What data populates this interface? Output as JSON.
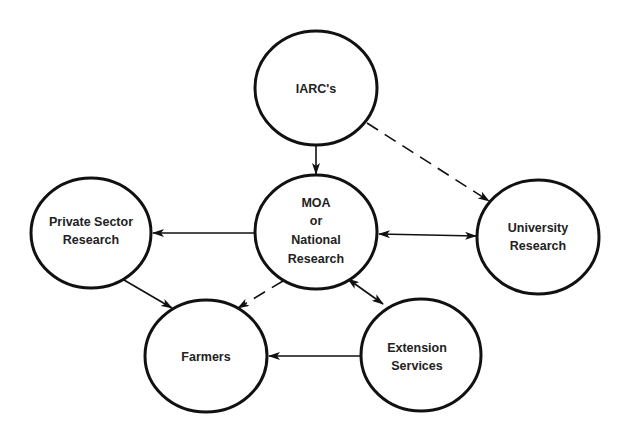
{
  "diagram": {
    "type": "network",
    "nodes": [
      {
        "id": "iarc",
        "lines": [
          "IARC's"
        ],
        "cx": 316,
        "cy": 88,
        "rx": 61,
        "ry": 57
      },
      {
        "id": "moa",
        "lines": [
          "MOA",
          "or",
          "National",
          "Research"
        ],
        "cx": 316,
        "cy": 232,
        "rx": 61,
        "ry": 57
      },
      {
        "id": "private",
        "lines": [
          "Private Sector",
          "Research"
        ],
        "cx": 91,
        "cy": 233,
        "rx": 60,
        "ry": 55
      },
      {
        "id": "university",
        "lines": [
          "University",
          "Research"
        ],
        "cx": 538,
        "cy": 237,
        "rx": 61,
        "ry": 57
      },
      {
        "id": "farmers",
        "lines": [
          "Farmers"
        ],
        "cx": 206,
        "cy": 356,
        "rx": 61,
        "ry": 56
      },
      {
        "id": "extension",
        "lines": [
          "Extension",
          "Services"
        ],
        "cx": 421,
        "cy": 355,
        "rx": 60,
        "ry": 56
      }
    ],
    "edges": [
      {
        "from": "iarc",
        "to": "moa",
        "style": "solid",
        "direction": "forward"
      },
      {
        "from": "iarc",
        "to": "university",
        "style": "dashed",
        "direction": "forward"
      },
      {
        "from": "moa",
        "to": "private",
        "style": "solid",
        "direction": "forward"
      },
      {
        "from": "moa",
        "to": "university",
        "style": "solid",
        "direction": "both"
      },
      {
        "from": "moa",
        "to": "farmers",
        "style": "dashed",
        "direction": "forward"
      },
      {
        "from": "moa",
        "to": "extension",
        "style": "solid",
        "direction": "both"
      },
      {
        "from": "private",
        "to": "farmers",
        "style": "solid",
        "direction": "forward"
      },
      {
        "from": "extension",
        "to": "farmers",
        "style": "solid",
        "direction": "forward"
      }
    ]
  },
  "labels": {
    "iarc": {
      "l1": "IARC's"
    },
    "moa": {
      "l1": "MOA",
      "l2": "or",
      "l3": "National",
      "l4": "Research"
    },
    "private": {
      "l1": "Private Sector",
      "l2": "Research"
    },
    "university": {
      "l1": "University",
      "l2": "Research"
    },
    "farmers": {
      "l1": "Farmers"
    },
    "extension": {
      "l1": "Extension",
      "l2": "Services"
    }
  },
  "colors": {
    "stroke": "#111111",
    "text": "#222222",
    "background": "#ffffff"
  }
}
